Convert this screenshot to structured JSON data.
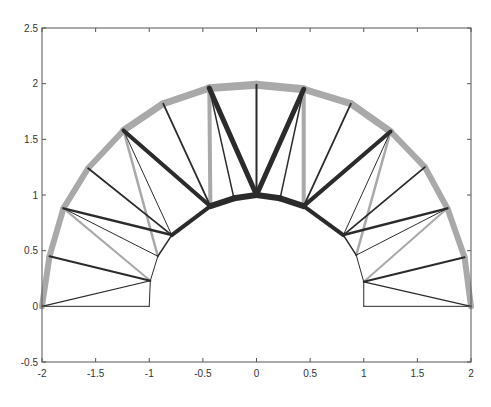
{
  "chart_data": {
    "type": "line",
    "title": "",
    "xlabel": "",
    "ylabel": "",
    "xlim": [
      -2,
      2
    ],
    "ylim": [
      -0.5,
      2.5
    ],
    "grid": false,
    "legend": null,
    "xticks": [
      -2,
      -1.5,
      -1,
      -0.5,
      0,
      0.5,
      1,
      1.5,
      2
    ],
    "xtick_labels": [
      "-2",
      "-1.5",
      "-1",
      "-0.5",
      "0",
      "0.5",
      "1",
      "1.5",
      "2"
    ],
    "yticks": [
      -0.5,
      0,
      0.5,
      1,
      1.5,
      2,
      2.5
    ],
    "ytick_labels": [
      "-0.5",
      "0",
      "0.5",
      "1",
      "1.5",
      "2",
      "2.5"
    ],
    "nodes": {
      "outer": [
        [
          -2,
          0
        ],
        [
          -1.93,
          0.45
        ],
        [
          -1.8,
          0.88
        ],
        [
          -1.57,
          1.24
        ],
        [
          -1.24,
          1.58
        ],
        [
          -0.87,
          1.82
        ],
        [
          -0.44,
          1.96
        ],
        [
          0,
          1.99
        ],
        [
          0.44,
          1.95
        ],
        [
          0.88,
          1.82
        ],
        [
          1.25,
          1.57
        ],
        [
          1.57,
          1.25
        ],
        [
          1.78,
          0.88
        ],
        [
          1.94,
          0.44
        ],
        [
          2,
          0
        ]
      ],
      "inner": [
        [
          -1,
          0
        ],
        [
          -0.99,
          0.23
        ],
        [
          -0.92,
          0.45
        ],
        [
          -0.79,
          0.64
        ],
        [
          -0.43,
          0.9
        ],
        [
          -0.21,
          0.97
        ],
        [
          0,
          1.0
        ],
        [
          0.22,
          0.97
        ],
        [
          0.44,
          0.9
        ],
        [
          0.81,
          0.64
        ],
        [
          0.93,
          0.46
        ],
        [
          1.0,
          0.22
        ],
        [
          1,
          0
        ]
      ]
    },
    "members": [
      {
        "from": [
          "outer",
          0
        ],
        "to": [
          "outer",
          1
        ],
        "style": "gray",
        "width": 6
      },
      {
        "from": [
          "outer",
          1
        ],
        "to": [
          "outer",
          2
        ],
        "style": "gray",
        "width": 6
      },
      {
        "from": [
          "outer",
          2
        ],
        "to": [
          "outer",
          3
        ],
        "style": "gray",
        "width": 6
      },
      {
        "from": [
          "outer",
          3
        ],
        "to": [
          "outer",
          4
        ],
        "style": "gray",
        "width": 6
      },
      {
        "from": [
          "outer",
          4
        ],
        "to": [
          "outer",
          5
        ],
        "style": "gray",
        "width": 7
      },
      {
        "from": [
          "outer",
          5
        ],
        "to": [
          "outer",
          6
        ],
        "style": "gray",
        "width": 7
      },
      {
        "from": [
          "outer",
          6
        ],
        "to": [
          "outer",
          7
        ],
        "style": "gray",
        "width": 8
      },
      {
        "from": [
          "outer",
          7
        ],
        "to": [
          "outer",
          8
        ],
        "style": "gray",
        "width": 8
      },
      {
        "from": [
          "outer",
          8
        ],
        "to": [
          "outer",
          9
        ],
        "style": "gray",
        "width": 7
      },
      {
        "from": [
          "outer",
          9
        ],
        "to": [
          "outer",
          10
        ],
        "style": "gray",
        "width": 7
      },
      {
        "from": [
          "outer",
          10
        ],
        "to": [
          "outer",
          11
        ],
        "style": "gray",
        "width": 6
      },
      {
        "from": [
          "outer",
          11
        ],
        "to": [
          "outer",
          12
        ],
        "style": "gray",
        "width": 6
      },
      {
        "from": [
          "outer",
          12
        ],
        "to": [
          "outer",
          13
        ],
        "style": "gray",
        "width": 6
      },
      {
        "from": [
          "outer",
          13
        ],
        "to": [
          "outer",
          14
        ],
        "style": "gray",
        "width": 6
      },
      {
        "from": [
          "inner",
          0
        ],
        "to": [
          "inner",
          1
        ],
        "style": "dark",
        "width": 1
      },
      {
        "from": [
          "inner",
          1
        ],
        "to": [
          "inner",
          2
        ],
        "style": "dark",
        "width": 1
      },
      {
        "from": [
          "inner",
          2
        ],
        "to": [
          "inner",
          3
        ],
        "style": "dark",
        "width": 1.5
      },
      {
        "from": [
          "inner",
          3
        ],
        "to": [
          "inner",
          4
        ],
        "style": "dark",
        "width": 4
      },
      {
        "from": [
          "inner",
          4
        ],
        "to": [
          "inner",
          5
        ],
        "style": "dark",
        "width": 6
      },
      {
        "from": [
          "inner",
          5
        ],
        "to": [
          "inner",
          6
        ],
        "style": "dark",
        "width": 6
      },
      {
        "from": [
          "inner",
          6
        ],
        "to": [
          "inner",
          7
        ],
        "style": "dark",
        "width": 6
      },
      {
        "from": [
          "inner",
          7
        ],
        "to": [
          "inner",
          8
        ],
        "style": "dark",
        "width": 6
      },
      {
        "from": [
          "inner",
          8
        ],
        "to": [
          "inner",
          9
        ],
        "style": "dark",
        "width": 4
      },
      {
        "from": [
          "inner",
          9
        ],
        "to": [
          "inner",
          10
        ],
        "style": "dark",
        "width": 1.5
      },
      {
        "from": [
          "inner",
          10
        ],
        "to": [
          "inner",
          11
        ],
        "style": "dark",
        "width": 1
      },
      {
        "from": [
          "inner",
          11
        ],
        "to": [
          "inner",
          12
        ],
        "style": "dark",
        "width": 1
      },
      {
        "from": [
          "outer",
          0
        ],
        "to": [
          "inner",
          0
        ],
        "style": "dark",
        "width": 1
      },
      {
        "from": [
          "outer",
          0
        ],
        "to": [
          "inner",
          1
        ],
        "style": "dark",
        "width": 1.2
      },
      {
        "from": [
          "outer",
          1
        ],
        "to": [
          "inner",
          1
        ],
        "style": "dark",
        "width": 2
      },
      {
        "from": [
          "outer",
          2
        ],
        "to": [
          "inner",
          1
        ],
        "style": "gray",
        "width": 2
      },
      {
        "from": [
          "outer",
          2
        ],
        "to": [
          "inner",
          2
        ],
        "style": "dark",
        "width": 1
      },
      {
        "from": [
          "outer",
          2
        ],
        "to": [
          "inner",
          3
        ],
        "style": "dark",
        "width": 2.5
      },
      {
        "from": [
          "outer",
          3
        ],
        "to": [
          "inner",
          3
        ],
        "style": "dark",
        "width": 1.8
      },
      {
        "from": [
          "outer",
          4
        ],
        "to": [
          "inner",
          2
        ],
        "style": "gray",
        "width": 2.5
      },
      {
        "from": [
          "outer",
          4
        ],
        "to": [
          "inner",
          3
        ],
        "style": "dark",
        "width": 1
      },
      {
        "from": [
          "outer",
          4
        ],
        "to": [
          "inner",
          4
        ],
        "style": "dark",
        "width": 4
      },
      {
        "from": [
          "outer",
          5
        ],
        "to": [
          "inner",
          4
        ],
        "style": "dark",
        "width": 1.8
      },
      {
        "from": [
          "outer",
          6
        ],
        "to": [
          "inner",
          4
        ],
        "style": "gray",
        "width": 4
      },
      {
        "from": [
          "outer",
          6
        ],
        "to": [
          "inner",
          5
        ],
        "style": "dark",
        "width": 1.5
      },
      {
        "from": [
          "outer",
          6
        ],
        "to": [
          "inner",
          6
        ],
        "style": "dark",
        "width": 5
      },
      {
        "from": [
          "outer",
          7
        ],
        "to": [
          "inner",
          6
        ],
        "style": "dark",
        "width": 2
      },
      {
        "from": [
          "outer",
          8
        ],
        "to": [
          "inner",
          6
        ],
        "style": "dark",
        "width": 5
      },
      {
        "from": [
          "outer",
          8
        ],
        "to": [
          "inner",
          7
        ],
        "style": "dark",
        "width": 1.5
      },
      {
        "from": [
          "outer",
          8
        ],
        "to": [
          "inner",
          8
        ],
        "style": "gray",
        "width": 4
      },
      {
        "from": [
          "outer",
          9
        ],
        "to": [
          "inner",
          8
        ],
        "style": "dark",
        "width": 1.8
      },
      {
        "from": [
          "outer",
          10
        ],
        "to": [
          "inner",
          8
        ],
        "style": "dark",
        "width": 4
      },
      {
        "from": [
          "outer",
          10
        ],
        "to": [
          "inner",
          9
        ],
        "style": "dark",
        "width": 1
      },
      {
        "from": [
          "outer",
          10
        ],
        "to": [
          "inner",
          10
        ],
        "style": "gray",
        "width": 2.5
      },
      {
        "from": [
          "outer",
          11
        ],
        "to": [
          "inner",
          9
        ],
        "style": "dark",
        "width": 1.8
      },
      {
        "from": [
          "outer",
          12
        ],
        "to": [
          "inner",
          9
        ],
        "style": "dark",
        "width": 2.5
      },
      {
        "from": [
          "outer",
          12
        ],
        "to": [
          "inner",
          10
        ],
        "style": "dark",
        "width": 1
      },
      {
        "from": [
          "outer",
          12
        ],
        "to": [
          "inner",
          11
        ],
        "style": "gray",
        "width": 2
      },
      {
        "from": [
          "outer",
          13
        ],
        "to": [
          "inner",
          11
        ],
        "style": "dark",
        "width": 2
      },
      {
        "from": [
          "outer",
          14
        ],
        "to": [
          "inner",
          11
        ],
        "style": "dark",
        "width": 1.2
      },
      {
        "from": [
          "outer",
          14
        ],
        "to": [
          "inner",
          12
        ],
        "style": "dark",
        "width": 1
      }
    ]
  },
  "colors": {
    "gray": "#a9a9a9",
    "dark": "#2b2b2b",
    "axis": "#555555",
    "background": "#ffffff"
  },
  "plot_area": {
    "left": 42,
    "right": 471,
    "top": 28,
    "bottom": 362
  }
}
